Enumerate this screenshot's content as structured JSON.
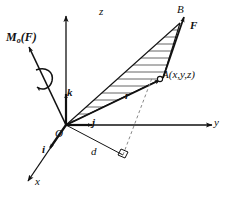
{
  "figure": {
    "background_color": "#ffffff",
    "line_color": "#111111",
    "hatch_color": "#555555"
  },
  "axes": {
    "z_label": "z",
    "y_label": "y",
    "x_label": "x"
  },
  "unit_vectors": {
    "i_label": "i",
    "j_label": "j",
    "k_label": "k"
  },
  "points": {
    "origin_label": "O",
    "point_a_label": "A(x,y,z)",
    "point_b_label": "B"
  },
  "vectors": {
    "force_label": "F",
    "position_label": "r",
    "moment_symbol": "M",
    "moment_subscript": "o",
    "moment_argument": "(F)",
    "moment_label": "Mo(F)"
  },
  "distances": {
    "perpendicular_label": "d"
  }
}
